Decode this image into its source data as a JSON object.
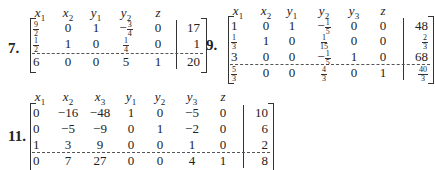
{
  "problems": [
    {
      "number": "7.",
      "headers": [
        "x1",
        "x2",
        "y1",
        "y2",
        "z"
      ],
      "rows": [
        [
          "9/2",
          "0",
          "1",
          "-3/4",
          "0",
          "17"
        ],
        [
          "1/2",
          "1",
          "0",
          "1/4",
          "0",
          "1"
        ],
        [
          "6",
          "0",
          "0",
          "5",
          "1",
          "20"
        ]
      ]
    },
    {
      "number": "9.",
      "headers": [
        "x1",
        "x2",
        "y1",
        "y2",
        "y3",
        "z"
      ],
      "rows": [
        [
          "1",
          "0",
          "1",
          "-1/5",
          "0",
          "0",
          "48"
        ],
        [
          "1/3",
          "1",
          "0",
          "1/15",
          "0",
          "0",
          "2/3"
        ],
        [
          "3",
          "0",
          "0",
          "-1/5",
          "1",
          "0",
          "68"
        ],
        [
          "5/3",
          "0",
          "0",
          "4/3",
          "0",
          "1",
          "40/3"
        ]
      ]
    },
    {
      "number": "11.",
      "headers": [
        "x1",
        "x2",
        "x3",
        "y1",
        "y2",
        "y3",
        "z"
      ],
      "rows": [
        [
          "0",
          "-16",
          "-48",
          "1",
          "0",
          "-5",
          "0",
          "10"
        ],
        [
          "0",
          "-5",
          "-9",
          "0",
          "1",
          "-2",
          "0",
          "6"
        ],
        [
          "1",
          "3",
          "9",
          "0",
          "0",
          "1",
          "0",
          "2"
        ],
        [
          "0",
          "7",
          "27",
          "0",
          "0",
          "4",
          "1",
          "8"
        ]
      ]
    }
  ]
}
